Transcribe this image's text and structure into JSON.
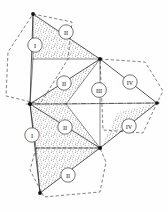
{
  "figure": {
    "background_color": "#fefefe",
    "line_color": "#1d1d1d",
    "stipple_color": "#4a4a4a",
    "width": 168,
    "height": 212
  },
  "labels": [
    {
      "id": "label-1",
      "text": "I",
      "cx": 35,
      "cy": 45,
      "r": 7.2
    },
    {
      "id": "label-2",
      "text": "II",
      "cx": 66,
      "cy": 32,
      "r": 7.2
    },
    {
      "id": "label-3",
      "text": "II",
      "cx": 64,
      "cy": 83,
      "r": 7.2
    },
    {
      "id": "label-4",
      "text": "III",
      "cx": 99,
      "cy": 90,
      "r": 7.4
    },
    {
      "id": "label-5",
      "text": "IV",
      "cx": 130,
      "cy": 82,
      "r": 7.2
    },
    {
      "id": "label-6",
      "text": "I",
      "cx": 32,
      "cy": 135,
      "r": 7.2
    },
    {
      "id": "label-7",
      "text": "II",
      "cx": 65,
      "cy": 127,
      "r": 7.2
    },
    {
      "id": "label-8",
      "text": "IV",
      "cx": 129,
      "cy": 126,
      "r": 7.2
    },
    {
      "id": "label-9",
      "text": "II",
      "cx": 68,
      "cy": 175,
      "r": 7.2
    }
  ],
  "vertices": [
    {
      "id": "v-top",
      "x": 33,
      "y": 14
    },
    {
      "id": "v-left",
      "x": 30,
      "y": 104
    },
    {
      "id": "v-upper-center",
      "x": 100,
      "y": 59
    },
    {
      "id": "v-lower-center",
      "x": 100,
      "y": 148
    },
    {
      "id": "v-right",
      "x": 157,
      "y": 103
    },
    {
      "id": "v-bottom",
      "x": 40,
      "y": 193
    },
    {
      "id": "v-mid-upper",
      "x": 33,
      "y": 59
    },
    {
      "id": "v-mid-lower",
      "x": 36,
      "y": 148
    },
    {
      "id": "v-center",
      "x": 66,
      "y": 104
    }
  ],
  "facets": {
    "plain": [
      {
        "id": "facet-I-upper",
        "points": "33,14 33,59 30,104"
      },
      {
        "id": "facet-I-lower",
        "points": "30,104 36,148 40,193"
      },
      {
        "id": "facet-III-upper",
        "points": "100,59 66,104 100,148"
      },
      {
        "id": "facet-IV-wedge",
        "points": "100,59 157,103 100,148"
      }
    ],
    "stippled": [
      {
        "id": "facet-II-top",
        "points": "33,14 100,59 33,59"
      },
      {
        "id": "facet-II-mid-upper",
        "points": "30,104 100,59 66,104"
      },
      {
        "id": "facet-II-mid-lower",
        "points": "30,104 66,104 100,148 36,148"
      },
      {
        "id": "facet-II-bottom",
        "points": "36,148 100,148 40,193"
      },
      {
        "id": "facet-IV-lower",
        "points": "100,148 157,103 100,59"
      }
    ]
  },
  "solid_edges": [
    {
      "id": "edge-top-upper-center",
      "points": "33,14 100,59"
    },
    {
      "id": "edge-top-midupper",
      "points": "33,14 33,59"
    },
    {
      "id": "edge-top-left",
      "points": "33,14 30,104"
    },
    {
      "id": "edge-midupper-left",
      "points": "33,59 30,104"
    },
    {
      "id": "edge-midupper-uc",
      "points": "33,59 100,59"
    },
    {
      "id": "edge-left-uc",
      "points": "30,104 100,59"
    },
    {
      "id": "edge-left-center",
      "points": "30,104 66,104"
    },
    {
      "id": "edge-center-right",
      "points": "66,104 157,103"
    },
    {
      "id": "edge-uc-center",
      "points": "100,59 66,104"
    },
    {
      "id": "edge-uc-right",
      "points": "100,59 157,103"
    },
    {
      "id": "edge-uc-lc",
      "points": "100,59 100,148"
    },
    {
      "id": "edge-left-lc",
      "points": "30,104 100,148"
    },
    {
      "id": "edge-center-lc",
      "points": "66,104 100,148"
    },
    {
      "id": "edge-left-midlower",
      "points": "30,104 36,148"
    },
    {
      "id": "edge-midlower-lc",
      "points": "36,148 100,148"
    },
    {
      "id": "edge-left-bottom",
      "points": "30,104 40,193"
    },
    {
      "id": "edge-midlower-bottom",
      "points": "36,148 40,193"
    },
    {
      "id": "edge-bottom-lc",
      "points": "40,193 100,148"
    },
    {
      "id": "edge-lc-right",
      "points": "100,148 157,103"
    }
  ],
  "dashed_hexagons": [
    {
      "id": "hex-left",
      "points": "33,14 72,22 68,59 40,104 6,96 8,52"
    },
    {
      "id": "hex-right",
      "points": "100,59 145,62 163,91 157,103 143,133 103,130"
    },
    {
      "id": "hex-bottom",
      "points": "36,148 100,148 106,162 100,192 44,197 30,170"
    }
  ],
  "axis_lines": [
    {
      "id": "axis-horizontal",
      "points": "26,104 161,103"
    }
  ]
}
